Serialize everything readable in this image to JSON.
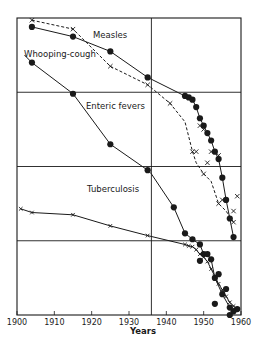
{
  "chart_data": {
    "type": "line",
    "title": "",
    "xlabel": "Years",
    "ylabel": "",
    "xlim": [
      1900,
      1960
    ],
    "ylim": [
      0,
      4
    ],
    "y_scale_note": "unlabelled relative (log) death-rate scale; 4 horizontal bands",
    "x_ticks": [
      "1900",
      "1910",
      "1920",
      "1930",
      "1940",
      "1950",
      "1960"
    ],
    "gridlines": {
      "horizontal": [
        1,
        2,
        3
      ],
      "vertical": [
        1936
      ]
    },
    "grid": true,
    "legend": "inline labels",
    "series": [
      {
        "name": "Measles",
        "style": "dashed",
        "marker": "x",
        "points": [
          [
            1904,
            3.97
          ],
          [
            1915,
            3.85
          ],
          [
            1925,
            3.35
          ],
          [
            1935,
            3.1
          ],
          [
            1941,
            2.85
          ],
          [
            1945,
            2.6
          ],
          [
            1947,
            2.2
          ],
          [
            1948,
            2.05
          ],
          [
            1950,
            1.9
          ],
          [
            1952,
            1.8
          ],
          [
            1954,
            1.5
          ],
          [
            1956,
            1.4
          ],
          [
            1958,
            1.25
          ]
        ],
        "scatter_x": [
          [
            1949,
            2.55
          ],
          [
            1950,
            2.5
          ],
          [
            1948,
            2.2
          ],
          [
            1952,
            2.2
          ],
          [
            1951,
            2.05
          ],
          [
            1954,
            2.15
          ],
          [
            1955,
            1.55
          ],
          [
            1959,
            1.6
          ],
          [
            1958,
            1.4
          ]
        ]
      },
      {
        "name": "Whooping-cough",
        "style": "solid",
        "marker": "dot",
        "points": [
          [
            1904,
            3.88
          ],
          [
            1915,
            3.75
          ],
          [
            1925,
            3.55
          ],
          [
            1935,
            3.2
          ],
          [
            1945,
            2.95
          ],
          [
            1946,
            2.93
          ],
          [
            1947,
            2.9
          ],
          [
            1948,
            2.8
          ],
          [
            1949,
            2.65
          ],
          [
            1950,
            2.55
          ],
          [
            1951,
            2.45
          ],
          [
            1952,
            2.35
          ],
          [
            1953,
            2.2
          ],
          [
            1954,
            2.1
          ],
          [
            1955,
            1.85
          ],
          [
            1956,
            1.55
          ],
          [
            1957,
            1.3
          ],
          [
            1958,
            1.05
          ]
        ]
      },
      {
        "name": "Enteric fevers",
        "style": "solid",
        "marker": "dot",
        "points": [
          [
            1902,
            3.5
          ],
          [
            1904,
            3.4
          ],
          [
            1915,
            2.98
          ],
          [
            1925,
            2.3
          ],
          [
            1935,
            1.95
          ],
          [
            1936,
            1.9
          ],
          [
            1942,
            1.45
          ],
          [
            1945,
            1.1
          ],
          [
            1947,
            1.02
          ],
          [
            1949,
            0.95
          ],
          [
            1950,
            0.82
          ],
          [
            1951,
            0.82
          ],
          [
            1952,
            0.75
          ],
          [
            1953,
            0.5
          ],
          [
            1955,
            0.28
          ],
          [
            1957,
            0.1
          ],
          [
            1959,
            0.08
          ]
        ],
        "scatter_dots": [
          [
            1949,
            0.73
          ],
          [
            1954,
            0.55
          ],
          [
            1956,
            0.35
          ],
          [
            1953,
            0.15
          ],
          [
            1957,
            0.0
          ],
          [
            1958,
            0.05
          ]
        ]
      },
      {
        "name": "Tuberculosis",
        "style": "solid",
        "marker": "x",
        "points": [
          [
            1901,
            1.43
          ],
          [
            1904,
            1.38
          ],
          [
            1915,
            1.35
          ],
          [
            1925,
            1.2
          ],
          [
            1935,
            1.07
          ],
          [
            1945,
            0.95
          ],
          [
            1946,
            0.93
          ],
          [
            1947,
            0.92
          ],
          [
            1948,
            0.88
          ],
          [
            1949,
            0.82
          ],
          [
            1950,
            0.78
          ],
          [
            1951,
            0.72
          ],
          [
            1952,
            0.62
          ],
          [
            1953,
            0.52
          ],
          [
            1954,
            0.42
          ],
          [
            1955,
            0.34
          ],
          [
            1956,
            0.25
          ],
          [
            1957,
            0.17
          ],
          [
            1958,
            0.12
          ],
          [
            1959,
            0.08
          ]
        ]
      }
    ],
    "annotations": [
      {
        "text": "Measles",
        "x": 1924,
        "y": 3.72
      },
      {
        "text": "Whooping-cough",
        "x": 1902,
        "y": 3.47
      },
      {
        "text": "Enteric fevers",
        "x": 1914,
        "y": 2.64
      },
      {
        "text": "Tuberculosis",
        "x": 1914,
        "y": 1.34
      }
    ]
  },
  "labels": {
    "measles": "Measles",
    "whooping": "Whooping-cough",
    "enteric": "Enteric fevers",
    "tb": "Tuberculosis",
    "xaxis": "Years",
    "ticks": [
      "1900",
      "1910",
      "1920",
      "1930",
      "1940",
      "1950",
      "1960"
    ]
  },
  "colors": {
    "ink": "#1a1a1a",
    "background": "#ffffff"
  }
}
